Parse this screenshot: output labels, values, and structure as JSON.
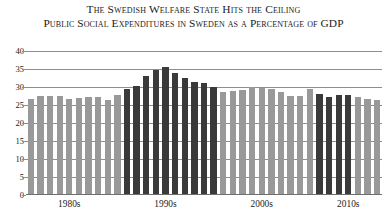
{
  "titles": {
    "main": "The Swedish Welfare State Hits the Ceiling",
    "sub": "Public Social Expenditures in Sweden as a Percentage of GDP"
  },
  "colors": {
    "bar_light": "#999999",
    "bar_dark": "#3a3a3a",
    "grid": "#8e8e8e",
    "text": "#1c1c1c",
    "background": "#ffffff"
  },
  "chart_data": {
    "type": "bar",
    "title": "The Swedish Welfare State Hits the Ceiling",
    "subtitle": "Public Social Expenditures in Sweden as a Percentage of GDP",
    "xlabel": "",
    "ylabel": "",
    "ylim": [
      0,
      40
    ],
    "yticks": [
      0,
      5,
      10,
      15,
      20,
      25,
      30,
      35,
      40
    ],
    "ytick_labels": [
      "0",
      "5",
      "10",
      "15",
      "20",
      "25",
      "30",
      "35",
      "40"
    ],
    "grid": true,
    "legend": "none",
    "xtick_labels": [
      "1980s",
      "1990s",
      "2000s",
      "2010s"
    ],
    "xtick_positions": [
      1984,
      1994,
      2004,
      2013
    ],
    "categories": [
      "1980",
      "1981",
      "1982",
      "1983",
      "1984",
      "1985",
      "1986",
      "1987",
      "1988",
      "1989",
      "1990",
      "1991",
      "1992",
      "1993",
      "1994",
      "1995",
      "1996",
      "1997",
      "1998",
      "1999",
      "2000",
      "2001",
      "2002",
      "2003",
      "2004",
      "2005",
      "2006",
      "2007",
      "2008",
      "2009",
      "2010",
      "2011",
      "2012",
      "2013",
      "2014",
      "2015",
      "2016"
    ],
    "values": [
      26.8,
      27.6,
      27.6,
      27.5,
      26.7,
      27.0,
      27.2,
      27.3,
      26.4,
      27.8,
      29.5,
      30.3,
      33.0,
      34.7,
      35.5,
      34.0,
      32.5,
      31.3,
      31.0,
      30.1,
      28.6,
      28.8,
      29.3,
      30.1,
      29.8,
      29.4,
      28.5,
      27.6,
      27.6,
      29.5,
      28.0,
      27.2,
      27.8,
      27.8,
      27.2,
      26.7,
      26.5
    ],
    "series_shading": [
      "light",
      "light",
      "light",
      "light",
      "light",
      "light",
      "light",
      "light",
      "light",
      "light",
      "dark",
      "dark",
      "dark",
      "dark",
      "dark",
      "dark",
      "dark",
      "dark",
      "dark",
      "dark",
      "light",
      "light",
      "light",
      "light",
      "light",
      "light",
      "light",
      "light",
      "light",
      "light",
      "dark",
      "dark",
      "dark",
      "dark",
      "light",
      "light",
      "light"
    ]
  }
}
